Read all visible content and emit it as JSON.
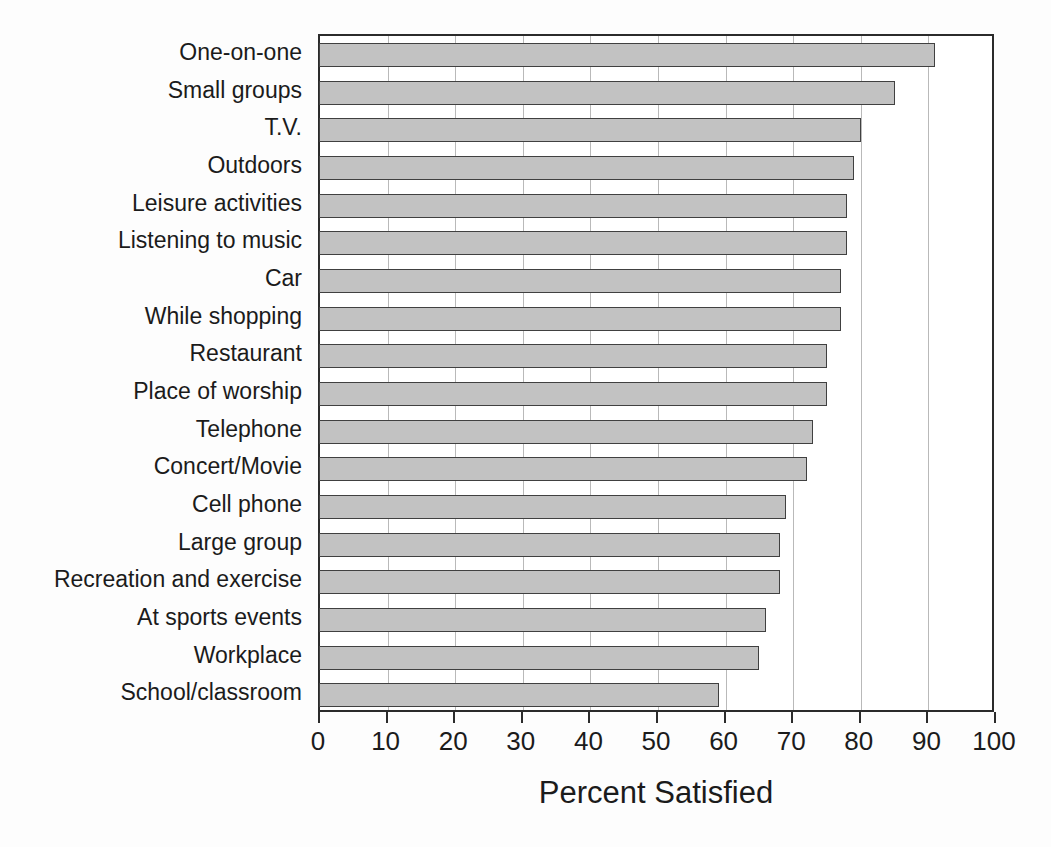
{
  "chart_data": {
    "type": "bar",
    "orientation": "horizontal",
    "title": "",
    "xlabel": "Percent Satisfied",
    "ylabel": "",
    "xlim": [
      0,
      100
    ],
    "xticks": [
      0,
      10,
      20,
      30,
      40,
      50,
      60,
      70,
      80,
      90,
      100
    ],
    "xtick_labels": [
      "0",
      "10",
      "20",
      "30",
      "40",
      "50",
      "60",
      "70",
      "80",
      "90",
      "100"
    ],
    "grid": "vertical",
    "legend": "none",
    "bar_fill_color": "#c2c2c2",
    "bar_edge_color": "#404040",
    "axis_color": "#2b2b2b",
    "gridline_color": "#b9b9b9",
    "categories": [
      "One-on-one",
      "Small groups",
      "T.V.",
      "Outdoors",
      "Leisure activities",
      "Listening to music",
      "Car",
      "While shopping",
      "Restaurant",
      "Place of worship",
      "Telephone",
      "Concert/Movie",
      "Cell phone",
      "Large group",
      "Recreation and exercise",
      "At sports events",
      "Workplace",
      "School/classroom"
    ],
    "values": [
      91,
      85,
      80,
      79,
      78,
      78,
      77,
      77,
      75,
      75,
      73,
      72,
      69,
      68,
      68,
      66,
      65,
      59
    ]
  }
}
